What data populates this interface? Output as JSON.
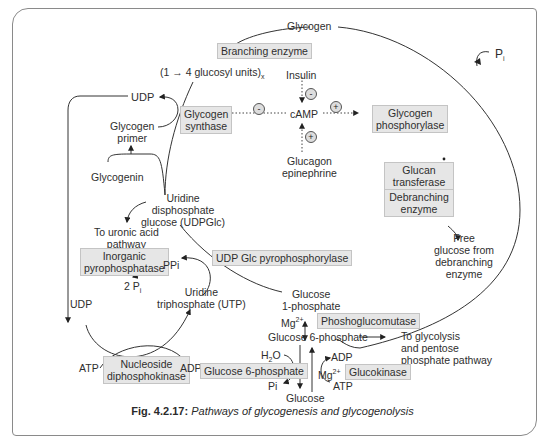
{
  "figure": {
    "caption_number": "Fig. 4.2.17:",
    "caption_text": "Pathways of glycogenesis and glycogenolysis"
  },
  "nodes": {
    "glycogen": "Glycogen",
    "glucosyl_units": "(1 → 4 glucosyl units)",
    "glucosyl_units_sub": "x",
    "udp_top": "UDP",
    "glycogen_primer_1": "Glycogen",
    "glycogen_primer_2": "primer",
    "glycogenin": "Glycogenin",
    "udpglc_1": "Uridine",
    "udpglc_2": "disphosphate",
    "udpglc_3": "glucose (UDPGlc)",
    "uronic_1": "To uronic acid",
    "uronic_2": "pathway",
    "ppi": "PPi",
    "two_pi": "2 P",
    "two_pi_sub": "i",
    "udp_bottom": "UDP",
    "utp_1": "Uridine",
    "utp_2": "triphosphate (UTP)",
    "atp_left": "ATP",
    "adp_left": "ADP",
    "insulin": "Insulin",
    "camp": "cAMP",
    "glucagon_1": "Glucagon",
    "glucagon_2": "epinephrine",
    "pi_top": "P",
    "pi_top_sub": "i",
    "free_glucose_1": "Free",
    "free_glucose_2": "glucose from",
    "free_glucose_3": "debranching",
    "free_glucose_4": "enzyme",
    "g1p_1": "Glucose",
    "g1p_2": "1-phosphate",
    "mg_1": "Mg",
    "mg_sup": "2+",
    "g6p": "Glucose 6-phosphate",
    "glycolysis_1": "To glycolysis",
    "glycolysis_2": "and pentose",
    "glycolysis_3": "phosphate pathway",
    "h2o": "H",
    "h2o_sub": "2",
    "h2o_o": "O",
    "adp_right": "ADP",
    "mg_2": "Mg",
    "atp_right": "ATP",
    "pi_bottom": "Pi",
    "glucose": "Glucose"
  },
  "enzymes": {
    "branching": "Branching enzyme",
    "glycogen_synthase_1": "Glycogen",
    "glycogen_synthase_2": "synthase",
    "glycogen_phosphorylase_1": "Glycogen",
    "glycogen_phosphorylase_2": "phosphorylase",
    "glucan_transferase_1": "Glucan",
    "glucan_transferase_2": "transferase",
    "debranching_1": "Debranching",
    "debranching_2": "enzyme",
    "inorganic_pp_1": "Inorganic",
    "inorganic_pp_2": "pyrophosphatase",
    "udp_glc_pp": "UDP Glc pyrophosphorylase",
    "phosphoglucomutase": "Phoshoglucomutase",
    "nucleoside_dpk_1": "Nucleoside",
    "nucleoside_dpk_2": "diphosphokinase",
    "glucose_6_phosphatase": "Glucose 6-phosphate",
    "glucokinase": "Glucokinase"
  },
  "regulation_signs": {
    "insulin_camp": "-",
    "camp_synthase": "-",
    "camp_phosphorylase": "+",
    "glucagon_camp": "+"
  },
  "colors": {
    "enzyme_box_fill": "#e6e6e6",
    "line": "#333333",
    "frame": "#8a8a8a"
  }
}
